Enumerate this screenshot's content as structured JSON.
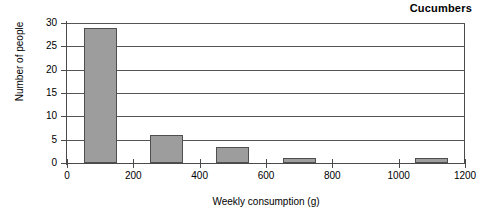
{
  "chart_data": {
    "type": "bar",
    "title": "Cucumbers",
    "xlabel": "Weekly consumption (g)",
    "ylabel": "Number of people",
    "xlim": [
      0,
      1200
    ],
    "ylim": [
      0,
      30
    ],
    "xticks": [
      0,
      200,
      400,
      600,
      800,
      1000,
      1200
    ],
    "yticks": [
      0,
      5,
      10,
      15,
      20,
      25,
      30
    ],
    "grid": "horizontal",
    "legend": "none",
    "bin_width": 100,
    "categories": [
      "50-150",
      "250-350",
      "450-550",
      "650-750",
      "850-950",
      "1050-1150"
    ],
    "bars": [
      {
        "label": "50-150",
        "x_start": 50,
        "x_end": 150,
        "value": 29
      },
      {
        "label": "250-350",
        "x_start": 250,
        "x_end": 350,
        "value": 6
      },
      {
        "label": "450-550",
        "x_start": 450,
        "x_end": 550,
        "value": 3.5
      },
      {
        "label": "650-750",
        "x_start": 650,
        "x_end": 750,
        "value": 1
      },
      {
        "label": "1050-1150",
        "x_start": 1050,
        "x_end": 1150,
        "value": 1
      }
    ],
    "values": [
      29,
      6,
      3.5,
      1,
      0,
      1
    ],
    "colors": {
      "bar_fill": "#9d9d9d",
      "bar_border": "#4f4f4f",
      "axis": "#4a4a4a",
      "gridline": "#555555",
      "background": "#ffffff",
      "text": "#000000"
    }
  }
}
